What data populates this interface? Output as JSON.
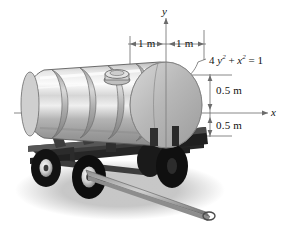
{
  "figure": {
    "background_color": "#ffffff",
    "line_color": "#4a4a4a",
    "ink_color": "#111111"
  },
  "axes": {
    "y_label": "y",
    "x_label": "x",
    "origin_note": "origin at center of elliptical tank face"
  },
  "dimensions": {
    "horizontal_left": "1 m",
    "horizontal_right": "1 m",
    "vertical_upper": "0.5 m",
    "vertical_lower": "0.5 m"
  },
  "equation": {
    "coefficient": "4",
    "term_y": "y",
    "exp_y": "2",
    "plus": "+",
    "term_x": "x",
    "exp_x": "2",
    "equals": "=",
    "rhs": "1",
    "full": "4 y² + x² = 1"
  },
  "object": {
    "name": "tanker-trailer",
    "parts": [
      "tank-shell",
      "tank-end-face",
      "rib-band",
      "top-hatch",
      "chassis-frame",
      "wheel",
      "drawbar",
      "ground-shadow"
    ],
    "wheel_count": 4,
    "rib_count": 5
  },
  "colors": {
    "tank_light": "#f2f2f2",
    "tank_mid": "#c9c9c9",
    "tank_dark": "#9a9a9a",
    "tank_face": "#b6b6b6",
    "frame_dark": "#2a2a2a",
    "frame_mid": "#4d4d4d",
    "tire": "#141414",
    "hub": "#d8d8d8",
    "shadow": "#c2c2c2"
  }
}
